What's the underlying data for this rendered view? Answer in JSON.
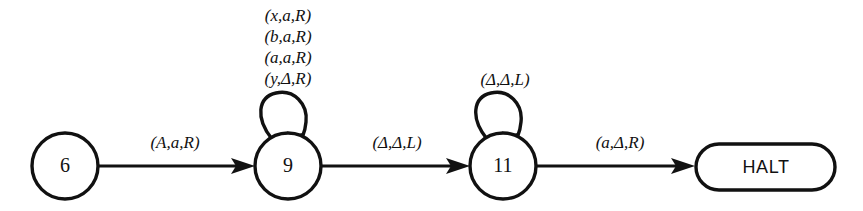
{
  "diagram": {
    "type": "state-transition-diagram",
    "background_color": "#ffffff",
    "stroke_color": "#111111",
    "states": [
      {
        "id": "6",
        "label": "6",
        "shape": "circle",
        "cx": 65,
        "cy": 166,
        "r": 33
      },
      {
        "id": "9",
        "label": "9",
        "shape": "circle",
        "cx": 288,
        "cy": 166,
        "r": 33
      },
      {
        "id": "11",
        "label": "11",
        "shape": "circle",
        "cx": 503,
        "cy": 166,
        "r": 33
      },
      {
        "id": "halt",
        "label": "HALT",
        "shape": "stadium",
        "cx": 765,
        "cy": 167
      }
    ],
    "transitions": [
      {
        "from": "6",
        "to": "9",
        "label": "(A,a,R)",
        "lx": 175,
        "ly": 144
      },
      {
        "from": "9",
        "to": "11",
        "label": "(Δ,Δ,L)",
        "lx": 397,
        "ly": 144
      },
      {
        "from": "11",
        "to": "halt",
        "label": "(a,Δ,R)",
        "lx": 620,
        "ly": 144
      }
    ],
    "self_loops": [
      {
        "state": "9",
        "labels": [
          "(x,a,R)",
          "(b,a,R)",
          "(a,a,R)",
          "(y,Δ,R)"
        ],
        "label_x": 288,
        "label_start_y": 17,
        "label_line_height": 20
      },
      {
        "state": "11",
        "labels": [
          "(Δ,Δ,L)"
        ],
        "label_x": 505,
        "label_start_y": 81,
        "label_line_height": 20
      }
    ]
  }
}
